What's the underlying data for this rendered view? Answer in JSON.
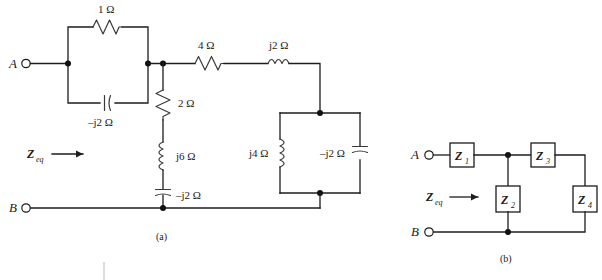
{
  "figure": {
    "panel_a": {
      "caption": "(a)",
      "terminal_top": "A",
      "terminal_bottom": "B",
      "zeq_label": "Z",
      "zeq_sub": "eq",
      "components": [
        {
          "name": "resistor-1-ohm",
          "label": "1 Ω",
          "type": "resistor"
        },
        {
          "name": "capacitor-neg-j2-ohm-left",
          "label": "–j2 Ω",
          "type": "capacitor"
        },
        {
          "name": "resistor-2-ohm",
          "label": "2 Ω",
          "type": "resistor"
        },
        {
          "name": "inductor-j6-ohm",
          "label": "j6 Ω",
          "type": "inductor"
        },
        {
          "name": "capacitor-neg-j2-ohm-middle",
          "label": "–j2 Ω",
          "type": "capacitor"
        },
        {
          "name": "resistor-4-ohm",
          "label": "4 Ω",
          "type": "resistor"
        },
        {
          "name": "inductor-j2-ohm",
          "label": "j2 Ω",
          "type": "inductor"
        },
        {
          "name": "inductor-j4-ohm",
          "label": "j4 Ω",
          "type": "inductor"
        },
        {
          "name": "capacitor-neg-j2-ohm-right",
          "label": "–j2 Ω",
          "type": "capacitor"
        }
      ]
    },
    "panel_b": {
      "caption": "(b)",
      "terminal_top": "A",
      "terminal_bottom": "B",
      "zeq_label": "Z",
      "zeq_sub": "eq",
      "impedance_boxes": [
        {
          "name": "impedance-z1",
          "label": "Z",
          "sub": "1"
        },
        {
          "name": "impedance-z2",
          "label": "Z",
          "sub": "2"
        },
        {
          "name": "impedance-z3",
          "label": "Z",
          "sub": "3"
        },
        {
          "name": "impedance-z4",
          "label": "Z",
          "sub": "4"
        }
      ]
    }
  },
  "colors": {
    "wire": "#1c1c1c",
    "component": "#3a3a3a",
    "background": "#ffffff",
    "text": "#1a1a1a"
  }
}
